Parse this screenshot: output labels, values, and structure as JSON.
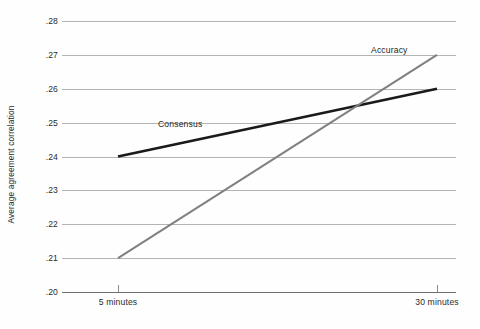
{
  "chart_data": {
    "type": "line",
    "title": "",
    "xlabel": "",
    "ylabel": "Average agreement correlation",
    "x": [
      "5 minutes",
      "30 minutes"
    ],
    "categories": [
      "5 minutes",
      "30 minutes"
    ],
    "ylim": [
      0.2,
      0.28
    ],
    "yticks": [
      0.2,
      0.21,
      0.22,
      0.23,
      0.24,
      0.25,
      0.26,
      0.27,
      0.28
    ],
    "ytick_labels": [
      ".20",
      ".21",
      ".22",
      ".23",
      ".24",
      ".25",
      ".26",
      ".27",
      ".28"
    ],
    "grid": true,
    "legend_position": "inline-annotations",
    "series": [
      {
        "name": "Consensus",
        "values": [
          0.24,
          0.26
        ],
        "color": "#1a1a1a",
        "width": 2.6
      },
      {
        "name": "Accuracy",
        "values": [
          0.21,
          0.27
        ],
        "color": "#808080",
        "width": 2.0
      }
    ],
    "annotations": [
      {
        "text": "Consensus",
        "series": "Consensus"
      },
      {
        "text": "Accuracy",
        "series": "Accuracy"
      }
    ]
  },
  "axes": {
    "y_title": "Average agreement correlation",
    "y_tick_labels": [
      ".28",
      ".27",
      ".26",
      ".25",
      ".24",
      ".23",
      ".22",
      ".21",
      ".20"
    ],
    "x_tick_labels": [
      "5 minutes",
      "30 minutes"
    ]
  },
  "colors": {
    "consensus": "#1a1a1a",
    "accuracy": "#808080",
    "gridline": "#b4b4b4",
    "baseline": "#6e6e6e",
    "background": "#fefefe"
  },
  "labels": {
    "consensus": "Consensus",
    "accuracy": "Accuracy"
  }
}
